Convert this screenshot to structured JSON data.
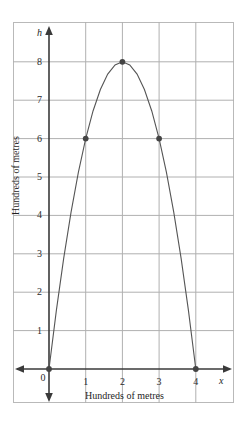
{
  "chart_data": {
    "type": "line",
    "title": "",
    "subtitle": "",
    "xlabel": "Hundreds of metres",
    "ylabel": "Hundreds of metres",
    "x_axis_name": "x",
    "y_axis_name": "h",
    "xlim": [
      0,
      4.4
    ],
    "ylim": [
      0,
      8.6
    ],
    "xticks": [
      "0",
      "1",
      "2",
      "3",
      "4"
    ],
    "xtick_values": [
      0,
      1,
      2,
      3,
      4
    ],
    "yticks": [
      "1",
      "2",
      "3",
      "4",
      "5",
      "6",
      "7",
      "8"
    ],
    "ytick_values": [
      1,
      2,
      3,
      4,
      5,
      6,
      7,
      8
    ],
    "grid": true,
    "legend": "none",
    "equation": "h = -2x^2 + 8x",
    "curve_color": "#555555",
    "marker_color": "#444444",
    "grid_color": "#b0b0b0",
    "axis_color": "#3a3a3a",
    "series": [
      {
        "name": "trajectory",
        "marked_points": [
          {
            "x": 0,
            "y": 0
          },
          {
            "x": 1,
            "y": 6
          },
          {
            "x": 2,
            "y": 8
          },
          {
            "x": 3,
            "y": 6
          },
          {
            "x": 4,
            "y": 0
          }
        ],
        "x": [
          0,
          0.2,
          0.4,
          0.6,
          0.8,
          1,
          1.2,
          1.4,
          1.6,
          1.8,
          2,
          2.2,
          2.4,
          2.6,
          2.8,
          3,
          3.2,
          3.4,
          3.6,
          3.8,
          4
        ],
        "values": [
          0,
          1.52,
          2.88,
          4.08,
          5.12,
          6,
          6.72,
          7.28,
          7.68,
          7.92,
          8,
          7.92,
          7.68,
          7.28,
          6.72,
          6,
          5.12,
          4.08,
          2.88,
          1.52,
          0
        ]
      }
    ]
  }
}
